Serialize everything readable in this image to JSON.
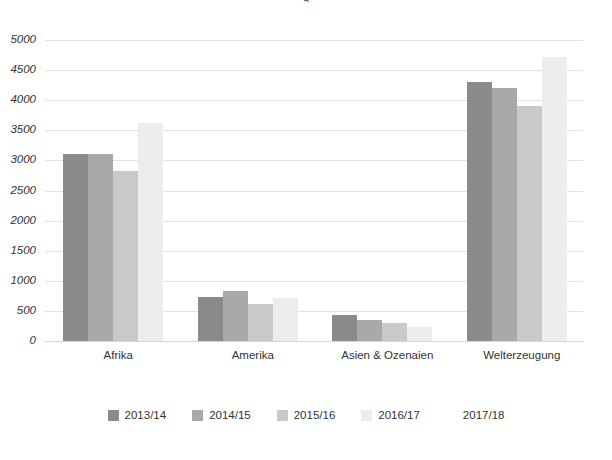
{
  "chart_data": {
    "type": "bar",
    "title": "",
    "xlabel": "",
    "ylabel": "",
    "ylim": [
      0,
      5000
    ],
    "ytick_step": 500,
    "grid": true,
    "legend_position": "bottom",
    "categories": [
      "Afrika",
      "Amerika",
      "Asien & Ozenaien",
      "Welterzeugung"
    ],
    "yticks": [
      "5000",
      "4500",
      "4000",
      "3500",
      "3000",
      "2500",
      "2000",
      "1500",
      "1000",
      "500",
      "0"
    ],
    "series": [
      {
        "name": "2013/14",
        "color": "#8a8a8a",
        "values": [
          3100,
          730,
          430,
          4300
        ]
      },
      {
        "name": "2014/15",
        "color": "#a9a9a9",
        "values": [
          3100,
          830,
          350,
          4200
        ]
      },
      {
        "name": "2015/16",
        "color": "#c9c9c9",
        "values": [
          2820,
          610,
          300,
          3900
        ]
      },
      {
        "name": "2016/17",
        "color": "#ededed",
        "values": [
          3620,
          720,
          240,
          4720
        ]
      },
      {
        "name": "2017/18",
        "color": "#ffffff",
        "values": [
          0,
          0,
          0,
          0
        ]
      }
    ]
  },
  "colors": {
    "gridline": "#e2e2e2",
    "text": "#333333",
    "background": "#ffffff"
  },
  "title_fragment": "g"
}
